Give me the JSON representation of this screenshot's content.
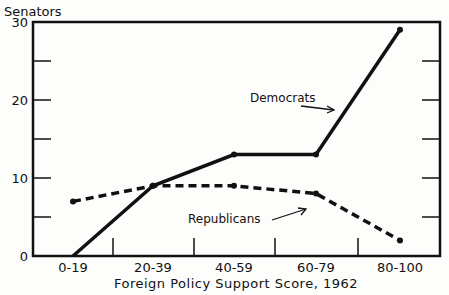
{
  "chart_data": {
    "type": "line",
    "title": "",
    "xlabel": "Foreign Policy Support Score, 1962",
    "ylabel": "Senators",
    "categories": [
      "0-19",
      "20-39",
      "40-59",
      "60-79",
      "80-100"
    ],
    "series": [
      {
        "name": "Democrats",
        "style": "solid",
        "values": [
          0,
          9,
          13,
          13,
          29
        ]
      },
      {
        "name": "Republicans",
        "style": "dashed",
        "values": [
          7,
          9,
          9,
          8,
          2
        ]
      }
    ],
    "yticks": [
      "0",
      "10",
      "20",
      "30"
    ],
    "ylim": [
      0,
      30
    ],
    "grid": false,
    "annotations": [
      "Democrats",
      "Republicans"
    ]
  }
}
